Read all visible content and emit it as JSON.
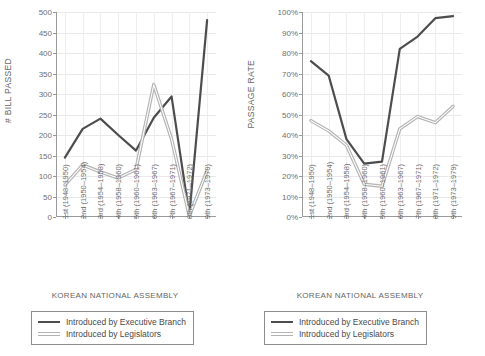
{
  "figure": {
    "caption": "",
    "xtitle": "KOREAN NATIONAL ASSEMBLY",
    "series_colors": {
      "executive": "#4d4d4d",
      "legislators": "#b3b3b3"
    },
    "legend": {
      "executive_label": "Introduced by Executive Branch",
      "legislators_label": "Introduced by Legislators"
    }
  },
  "chart_data": [
    {
      "type": "line",
      "title": "",
      "panel": "left",
      "ylabel": "# BILL PASSED",
      "xlabel": "KOREAN NATIONAL ASSEMBLY",
      "ylim": [
        0,
        500
      ],
      "yticks": [
        0,
        50,
        100,
        150,
        200,
        250,
        300,
        350,
        400,
        450,
        500
      ],
      "yticklabels": [
        "0",
        "50",
        "100",
        "150",
        "200",
        "250",
        "300",
        "350",
        "400",
        "450",
        "500"
      ],
      "grid": true,
      "legend_position": "below",
      "categories": [
        "1st (1948–1950)",
        "2nd (1950–1954)",
        "3rd (1954–1958)",
        "4th (1958–1960)",
        "5th (1960–1961)",
        "6th (1963–1967)",
        "7th (1967–1971)",
        "8th (1971–1972)",
        "9th (1973–1979)"
      ],
      "series": [
        {
          "name": "Introduced by Executive Branch",
          "values": [
            145,
            215,
            240,
            200,
            162,
            242,
            294,
            5,
            480
          ]
        },
        {
          "name": "Introduced by Legislators",
          "values": [
            78,
            127,
            110,
            95,
            116,
            323,
            190,
            3,
            113
          ]
        }
      ]
    },
    {
      "type": "line",
      "title": "",
      "panel": "right",
      "ylabel": "PASSAGE RATE",
      "xlabel": "KOREAN NATIONAL ASSEMBLY",
      "ylim": [
        0,
        100
      ],
      "yticks": [
        0,
        10,
        20,
        30,
        40,
        50,
        60,
        70,
        80,
        90,
        100
      ],
      "yticklabels": [
        "0%",
        "10%",
        "20%",
        "30%",
        "40%",
        "50%",
        "60%",
        "70%",
        "80%",
        "90%",
        "100%"
      ],
      "grid": true,
      "legend_position": "below",
      "categories": [
        "1st (1948–1950)",
        "2nd (1950–1954)",
        "3rd (1954–1958)",
        "4th (1958–1960)",
        "5th (1960–1961)",
        "6th (1963–1967)",
        "7th (1967–1971)",
        "8th (1971–1972)",
        "9th (1973–1979)"
      ],
      "series": [
        {
          "name": "Introduced by Executive Branch",
          "values": [
            76,
            69,
            38,
            26,
            27,
            82,
            88,
            97,
            98
          ]
        },
        {
          "name": "Introduced by Legislators",
          "values": [
            47,
            42,
            35,
            16,
            15,
            43,
            49,
            46,
            54
          ]
        }
      ]
    }
  ]
}
